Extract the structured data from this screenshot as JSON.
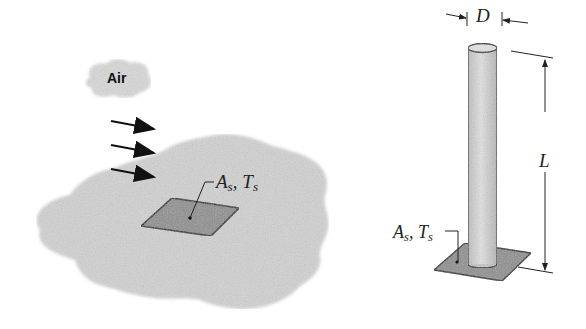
{
  "figure": {
    "left_panel": {
      "cloud_label": "Air",
      "flow_arrows": 3,
      "surface_label": {
        "symbol1": "A",
        "sub1": "s",
        "sep": ", ",
        "symbol2": "T",
        "sub2": "s"
      }
    },
    "right_panel": {
      "diameter_label": "D",
      "length_label": "L",
      "surface_label": {
        "symbol1": "A",
        "sub1": "s",
        "sep": ", ",
        "symbol2": "T",
        "sub2": "s"
      }
    },
    "colors": {
      "blob": "#d2d2d2",
      "surface_patch": "#8e8e8e",
      "cylinder": "#d6d6d6",
      "ink": "#222222"
    }
  }
}
